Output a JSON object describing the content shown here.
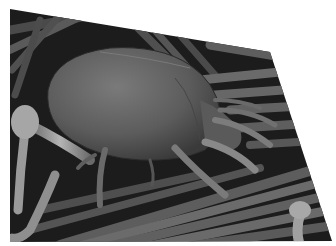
{
  "image": {
    "subject": "dust mite on fibers (scanning electron micrograph)",
    "style": "grayscale",
    "shape": "tilted quadrilateral on white background",
    "polygon": [
      [
        10,
        9
      ],
      [
        270,
        52
      ],
      [
        332,
        241
      ],
      [
        10,
        242
      ]
    ],
    "colors": {
      "background": "#ffffff",
      "dark": "#1a1a1a",
      "mid": "#5a5a5a",
      "light": "#a8a8a8"
    }
  }
}
